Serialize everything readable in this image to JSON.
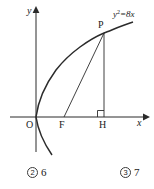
{
  "figure": {
    "axes": {
      "x_label": "x",
      "y_label": "y"
    },
    "curve_equation": {
      "base": "y",
      "exponent": "2",
      "rest": "=8x"
    },
    "points": [
      {
        "id": "O",
        "label": "O",
        "x": 36,
        "y": 117
      },
      {
        "id": "F",
        "label": "F",
        "x": 64,
        "y": 117
      },
      {
        "id": "H",
        "label": "H",
        "x": 104,
        "y": 117
      },
      {
        "id": "P",
        "label": "P",
        "x": 104,
        "y": 33
      }
    ]
  },
  "options": [
    {
      "marker": "2",
      "value": "6"
    },
    {
      "marker": "3",
      "value": "7"
    }
  ]
}
